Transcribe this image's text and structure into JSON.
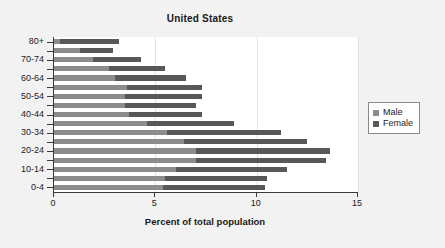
{
  "chart_data": {
    "type": "bar",
    "title": "United States",
    "xlabel": "Percent of total population",
    "ylabel": "",
    "orientation": "horizontal",
    "grid": true,
    "xlim": [
      0,
      15
    ],
    "xticks": [
      0,
      5,
      10,
      15
    ],
    "xtick_labels": [
      "0",
      "5",
      "10",
      "15"
    ],
    "legend_position": "right",
    "categories": [
      "80+",
      "75-79",
      "70-74",
      "65-69",
      "60-64",
      "55-59",
      "50-54",
      "45-49",
      "40-44",
      "35-39",
      "30-34",
      "25-29",
      "20-24",
      "15-19",
      "10-14",
      "5-9",
      "0-4"
    ],
    "ytick_labels": [
      "80+",
      "70-74",
      "60-64",
      "50-54",
      "40-44",
      "30-34",
      "20-24",
      "10-14",
      "0-4"
    ],
    "series": [
      {
        "name": "Male",
        "color": "#8c8c8c",
        "values": [
          0.3,
          1.3,
          1.9,
          2.7,
          3.0,
          3.6,
          3.5,
          3.5,
          3.7,
          4.6,
          5.6,
          6.4,
          7.0,
          7.0,
          6.0,
          5.5,
          5.4
        ]
      },
      {
        "name": "Female",
        "color": "#585858",
        "values": [
          3.2,
          2.9,
          4.3,
          5.5,
          6.5,
          7.3,
          7.3,
          7.0,
          7.3,
          8.9,
          11.2,
          12.5,
          13.6,
          13.4,
          11.5,
          10.5,
          10.4
        ]
      }
    ]
  },
  "legend": {
    "items": [
      {
        "label": "Male",
        "color": "#8c8c8c"
      },
      {
        "label": "Female",
        "color": "#585858"
      }
    ]
  }
}
